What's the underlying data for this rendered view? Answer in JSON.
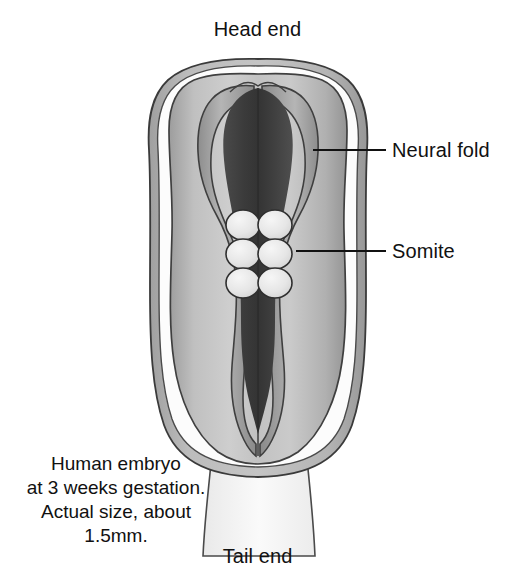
{
  "figure": {
    "title_head": "Head end",
    "title_tail": "Tail end",
    "callouts": [
      {
        "key": "neural_fold",
        "label": "Neural fold",
        "leader_from_x": 313,
        "leader_from_y": 150,
        "leader_to_x": 386,
        "leader_to_y": 150
      },
      {
        "key": "somite",
        "label": "Somite",
        "leader_from_x": 296,
        "leader_from_y": 251,
        "leader_to_x": 386,
        "leader_to_y": 251
      }
    ],
    "caption": {
      "line1": "Human embryo",
      "line2": "at 3 weeks gestation.",
      "line3": "Actual size, about",
      "line4": "1.5mm."
    },
    "structures": {
      "amnion": "amnion-outer-membrane",
      "amniotic_cavity": "amniotic-cavity-clear-band",
      "embryo_body": "embryonic-disc-body",
      "neural_fold_left": "neural-fold-left",
      "neural_fold_right": "neural-fold-right",
      "neural_groove": "neural-groove-dark-midline",
      "connecting_stalk": "connecting-stalk",
      "somite_count": 6,
      "somite_pairs": 3
    },
    "colors": {
      "background": "#ffffff",
      "outline": "#3a3a3a",
      "amnion_fill": "#b0b0b0",
      "cavity_fill": "#fbfbfb",
      "body_light": "#c9c9c9",
      "body_mid": "#a8a8a8",
      "neural_fold_fill": "#9a9a9a",
      "neural_groove_dark": "#3f3f3f",
      "somite_fill": "#ebebeb",
      "text": "#111111"
    }
  }
}
